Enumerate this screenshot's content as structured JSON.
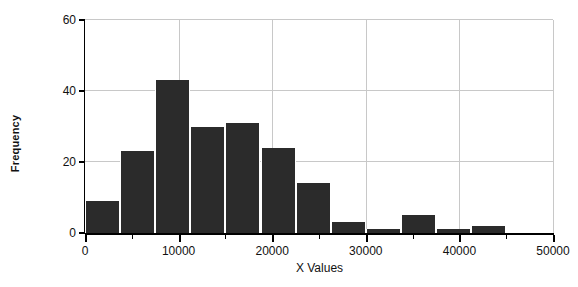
{
  "chart_data": {
    "type": "bar",
    "title": "",
    "xlabel": "X Values",
    "ylabel": "Frequency",
    "xlim": [
      0,
      50000
    ],
    "ylim": [
      0,
      60
    ],
    "grid": true,
    "legend": false,
    "bin_width": 3750,
    "bin_edges": [
      0,
      3750,
      7500,
      11250,
      15000,
      18750,
      22500,
      26250,
      30000,
      33750,
      37500,
      41250,
      45000,
      48750
    ],
    "categories": [
      "0-3750",
      "3750-7500",
      "7500-11250",
      "11250-15000",
      "15000-18750",
      "18750-22500",
      "22500-26250",
      "26250-30000",
      "30000-33750",
      "33750-37500",
      "37500-41250",
      "41250-45000",
      "45000-48750"
    ],
    "values": [
      9,
      23,
      43,
      30,
      31,
      24,
      14,
      3,
      1,
      5,
      1,
      2,
      0
    ],
    "x_tick_labels": [
      "0",
      "10000",
      "20000",
      "30000",
      "40000",
      "50000"
    ],
    "x_tick_values": [
      0,
      10000,
      20000,
      30000,
      40000,
      50000
    ],
    "x_minor_tick_values": [
      5000,
      15000,
      25000,
      35000,
      45000
    ],
    "y_tick_labels": [
      "0",
      "20",
      "40",
      "60"
    ],
    "y_tick_values": [
      0,
      20,
      40,
      60
    ],
    "bar_color": "#2b2b2b",
    "grid_color": "#c8c8c8",
    "axis_color": "#000000",
    "background_color": "#ffffff"
  }
}
